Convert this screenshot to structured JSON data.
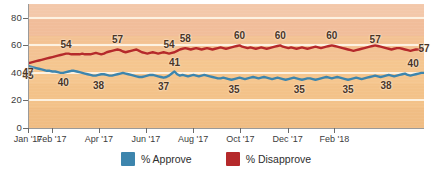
{
  "chart_data": {
    "type": "line",
    "title": "",
    "xlabel": "",
    "ylabel": "",
    "ylim": [
      0,
      90
    ],
    "yticks": [
      0,
      20,
      40,
      60,
      80
    ],
    "grid": true,
    "legend_position": "bottom",
    "x_tick_labels": [
      "Jan '17",
      "Feb '17",
      "Apr '17",
      "Jun '17",
      "Aug '17",
      "Oct '17",
      "Dec '17",
      "Feb '18"
    ],
    "x_tick_positions": [
      0,
      8.7,
      26.1,
      43.5,
      60.9,
      78.3,
      95.7,
      113.0
    ],
    "series": [
      {
        "name": "% Approve",
        "color": "#3d85ad",
        "values": [
          45,
          44.5,
          44,
          43.5,
          43,
          42.5,
          42,
          41.5,
          41.5,
          41,
          41,
          40.5,
          40,
          40,
          40.5,
          41,
          41.5,
          41.5,
          41,
          40.5,
          40,
          39.5,
          39,
          38.5,
          38,
          38,
          38.5,
          39,
          39,
          38.5,
          38,
          38,
          38.5,
          39,
          39.5,
          40,
          39.5,
          39,
          38.5,
          38,
          37.5,
          37,
          37,
          37.5,
          38,
          38.5,
          38.5,
          38,
          37.5,
          37,
          36.5,
          37,
          38,
          39.5,
          41,
          39,
          38,
          38.5,
          38,
          37.5,
          38,
          38.5,
          38,
          37.5,
          38,
          38.5,
          38,
          37.5,
          37,
          36.5,
          36,
          36,
          36.5,
          36,
          35.5,
          35,
          35.5,
          36,
          36.5,
          36,
          35.5,
          36,
          36.5,
          37,
          36.5,
          36,
          36.5,
          37,
          36.5,
          36,
          35.5,
          36,
          36.5,
          36,
          35.5,
          35,
          35.5,
          36,
          36.5,
          36,
          35.5,
          35,
          35.5,
          36,
          36,
          35.5,
          35,
          35.5,
          36,
          36.5,
          37,
          36.5,
          36,
          36.5,
          37,
          36.5,
          36,
          35.5,
          35,
          35.5,
          36,
          36.5,
          36,
          35.5,
          36,
          36.5,
          37,
          37.5,
          38,
          37.5,
          37,
          37.5,
          38,
          38.5,
          38,
          37.5,
          38,
          38.5,
          39,
          39.5,
          38.5,
          38,
          38.5,
          39,
          39.5,
          40,
          40
        ],
        "labels": [
          {
            "index": 0,
            "value": 45,
            "text": "45",
            "side": "below"
          },
          {
            "index": 13,
            "value": 40,
            "text": "40",
            "side": "below"
          },
          {
            "index": 26,
            "value": 38,
            "text": "38",
            "side": "below"
          },
          {
            "index": 50,
            "value": 37,
            "text": "37",
            "side": "below"
          },
          {
            "index": 54,
            "value": 41,
            "text": "41",
            "side": "above"
          },
          {
            "index": 76,
            "value": 35,
            "text": "35",
            "side": "below"
          },
          {
            "index": 100,
            "value": 35,
            "text": "35",
            "side": "below"
          },
          {
            "index": 118,
            "value": 35,
            "text": "35",
            "side": "below"
          },
          {
            "index": 132,
            "value": 38,
            "text": "38",
            "side": "below"
          },
          {
            "index": 142,
            "value": 40,
            "text": "40",
            "side": "above"
          }
        ]
      },
      {
        "name": "% Disapprove",
        "color": "#b5292b",
        "values": [
          47,
          47.5,
          48,
          48.5,
          49,
          49.5,
          50,
          50.5,
          51,
          51.5,
          52,
          52.5,
          53,
          53.5,
          54,
          54,
          53.5,
          53.5,
          53.5,
          53.5,
          54,
          53.5,
          53.5,
          53.5,
          54,
          54.5,
          54,
          53.5,
          54,
          55,
          55.5,
          56,
          56.5,
          57,
          56.5,
          55.5,
          55,
          55.5,
          56,
          56.5,
          57,
          56,
          55,
          54.5,
          54,
          54.5,
          55,
          54.5,
          54,
          54.5,
          55,
          54.5,
          54,
          54.5,
          55,
          56,
          57,
          57.5,
          58,
          57.5,
          57,
          57.5,
          58,
          57.5,
          57,
          57.5,
          58,
          57.5,
          57,
          57.5,
          58,
          58.5,
          58,
          57.5,
          58,
          58.5,
          59,
          59.5,
          60,
          59,
          58.5,
          58,
          58.5,
          58,
          57.5,
          58,
          58.5,
          58,
          57.5,
          58,
          58.5,
          59,
          59.5,
          60,
          59,
          58.5,
          58,
          58.5,
          58,
          57.5,
          58,
          58.5,
          58,
          57.5,
          58,
          58.5,
          59,
          58.5,
          58,
          58.5,
          59,
          59.5,
          60,
          59.5,
          59,
          58.5,
          58,
          57.5,
          57,
          56.5,
          56,
          56.5,
          57,
          57.5,
          58,
          58.5,
          59,
          59.5,
          60,
          59.5,
          59,
          58.5,
          58,
          57.5,
          57,
          57.5,
          58,
          58,
          57.5,
          57,
          56.5,
          56,
          56.5,
          57,
          57,
          57,
          57
        ],
        "labels": [
          {
            "index": 0,
            "value": 47,
            "text": "47",
            "side": "below"
          },
          {
            "index": 14,
            "value": 54,
            "text": "54",
            "side": "above"
          },
          {
            "index": 33,
            "value": 57,
            "text": "57",
            "side": "above"
          },
          {
            "index": 52,
            "value": 54,
            "text": "54",
            "side": "above"
          },
          {
            "index": 58,
            "value": 58,
            "text": "58",
            "side": "above"
          },
          {
            "index": 78,
            "value": 60,
            "text": "60",
            "side": "above"
          },
          {
            "index": 93,
            "value": 60,
            "text": "60",
            "side": "above"
          },
          {
            "index": 112,
            "value": 60,
            "text": "60",
            "side": "above"
          },
          {
            "index": 128,
            "value": 57,
            "text": "57",
            "side": "above"
          },
          {
            "index": 142,
            "value": 57,
            "text": "57",
            "side": "right"
          }
        ]
      }
    ]
  },
  "legend": {
    "items": [
      {
        "label": "% Approve",
        "color": "#3d85ad"
      },
      {
        "label": "% Disapprove",
        "color": "#b5292b"
      }
    ]
  }
}
